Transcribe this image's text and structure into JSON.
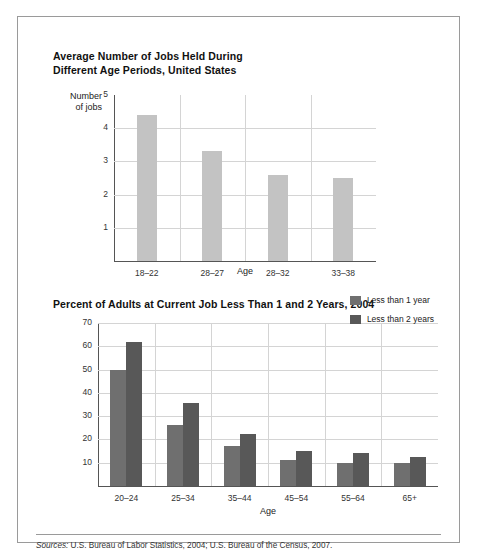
{
  "figure": {
    "source_prefix": "Sources:",
    "source_text": " U.S. Bureau of Labor Statistics, 2004; U.S. Bureau of the Census, 2007."
  },
  "chart_data": [
    {
      "type": "bar",
      "title": "Average Number of Jobs Held During Different Age Periods, United States",
      "title_line1": "Average Number of Jobs Held During",
      "title_line2": "Different Age Periods, United States",
      "categories": [
        "18–22",
        "28–27",
        "28–32",
        "33–38"
      ],
      "values": [
        4.4,
        3.3,
        2.6,
        2.5
      ],
      "xlabel": "Age",
      "ylabel": "Number of jobs",
      "ylabel_line1": "Number",
      "ylabel_line2": "of jobs",
      "yticks": [
        1,
        2,
        3,
        4,
        5
      ],
      "ylim": [
        0,
        5
      ],
      "grid": true,
      "legend": null,
      "bar_color": "#c3c3c3"
    },
    {
      "type": "bar",
      "title": "Percent of Adults at Current Job Less Than 1 and 2 Years, 2004",
      "categories": [
        "20–24",
        "25–34",
        "35–44",
        "45–54",
        "55–64",
        "65+"
      ],
      "series": [
        {
          "name": "Less than 1 year",
          "values": [
            50,
            26,
            17,
            11,
            10,
            10
          ],
          "color": "#6f6f6f"
        },
        {
          "name": "Less than 2 years",
          "values": [
            62,
            35.5,
            22.5,
            15,
            14,
            12.5
          ],
          "color": "#585858"
        }
      ],
      "xlabel": "Age",
      "ylabel": "",
      "yticks": [
        10,
        20,
        30,
        40,
        50,
        60,
        70
      ],
      "ylim": [
        0,
        70
      ],
      "grid": true,
      "legend_position": "top-right"
    }
  ]
}
